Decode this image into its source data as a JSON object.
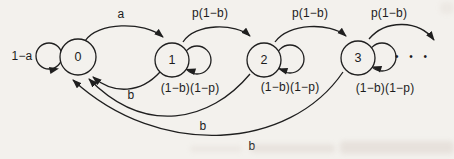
{
  "figure": {
    "kind": "markov-chain-state-diagram",
    "ink_color": "#1f1f1f",
    "paper_color": "#f3f1ed",
    "ellipsis": "•  •  •"
  },
  "diagram": {
    "type": "state-transition-diagram",
    "states": [
      "0",
      "1",
      "2",
      "3"
    ],
    "transitions": [
      {
        "from": "0",
        "to": "0",
        "label": "1−a"
      },
      {
        "from": "0",
        "to": "1",
        "label": "a"
      },
      {
        "from": "1",
        "to": "2",
        "label": "p(1−b)"
      },
      {
        "from": "2",
        "to": "3",
        "label": "p(1−b)"
      },
      {
        "from": "3",
        "to": "next",
        "label": "p(1−b)"
      },
      {
        "from": "1",
        "to": "1",
        "label": "(1−b)(1−p)"
      },
      {
        "from": "2",
        "to": "2",
        "label": "(1−b)(1−p)"
      },
      {
        "from": "3",
        "to": "3",
        "label": "(1−b)(1−p)"
      },
      {
        "from": "1",
        "to": "0",
        "label": "b"
      },
      {
        "from": "2",
        "to": "0",
        "label": "b"
      },
      {
        "from": "3",
        "to": "0",
        "label": "b"
      }
    ]
  }
}
